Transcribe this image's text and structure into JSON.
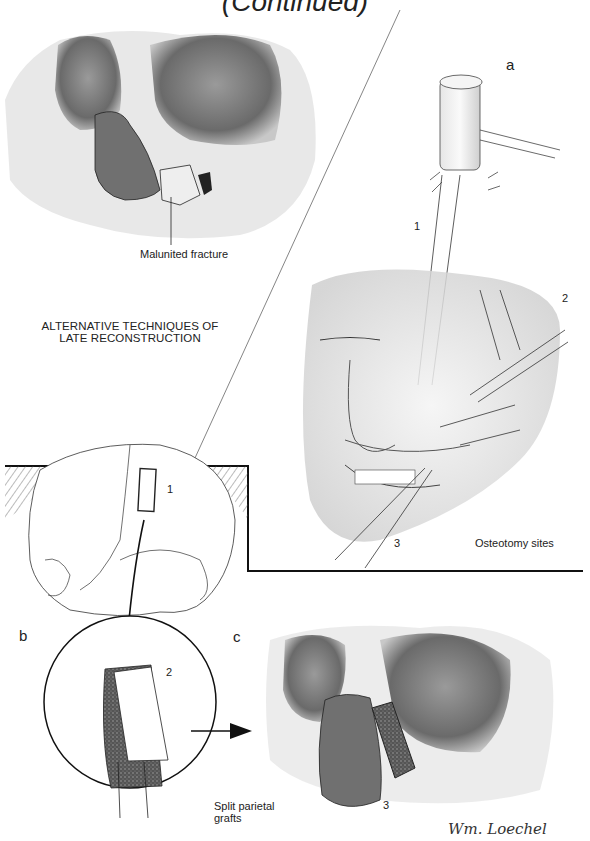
{
  "page": {
    "title": "(Continued)",
    "heading_lines": [
      "ALTERNATIVE TECHNIQUES OF",
      "LATE RECONSTRUCTION"
    ]
  },
  "panels": {
    "top_left": {
      "caption": "Malunited fracture"
    },
    "a": {
      "letter": "a",
      "caption": "Osteotomy sites",
      "numbers": [
        "1",
        "2",
        "3"
      ]
    },
    "skull": {
      "numbers": [
        "1"
      ]
    },
    "b": {
      "letter": "b",
      "numbers": [
        "2"
      ]
    },
    "c": {
      "letter": "c",
      "caption_lines": [
        "Split parietal",
        "grafts"
      ],
      "numbers": [
        "3"
      ]
    }
  },
  "signature": "Wm. Loechel",
  "icons": {
    "mallet": "mallet-icon",
    "arrow_down": "arrow-down-icon",
    "arrow_right": "arrow-right-icon"
  }
}
